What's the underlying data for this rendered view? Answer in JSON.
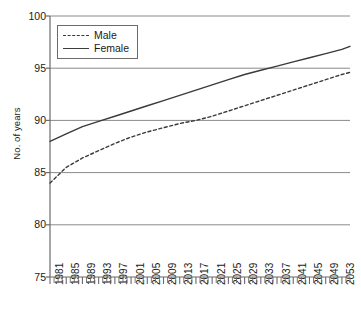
{
  "chart_data": {
    "type": "line",
    "title": "",
    "xlabel": "",
    "ylabel": "No. of years",
    "xlim": [
      1981,
      2055
    ],
    "ylim": [
      75,
      100
    ],
    "yticks": [
      75,
      80,
      85,
      90,
      95,
      100
    ],
    "xticks": [
      1981,
      1985,
      1989,
      1993,
      1997,
      2001,
      2005,
      2009,
      2013,
      2017,
      2021,
      2025,
      2029,
      2033,
      2037,
      2041,
      2045,
      2049,
      2053
    ],
    "grid": "horizontal",
    "legend_position": "top-left",
    "minor_x_tick_step": 1,
    "series": [
      {
        "name": "Male",
        "style": "dashed",
        "color": "#3a3a3a",
        "x": [
          1981,
          1985,
          1989,
          1993,
          1997,
          2001,
          2005,
          2009,
          2013,
          2017,
          2021,
          2025,
          2029,
          2033,
          2037,
          2041,
          2045,
          2049,
          2053,
          2055
        ],
        "values": [
          84.0,
          85.5,
          86.4,
          87.1,
          87.8,
          88.4,
          88.9,
          89.3,
          89.7,
          90.0,
          90.4,
          90.9,
          91.4,
          91.9,
          92.4,
          92.9,
          93.4,
          93.9,
          94.4,
          94.6
        ]
      },
      {
        "name": "Female",
        "style": "solid",
        "color": "#3a3a3a",
        "x": [
          1981,
          1985,
          1989,
          1993,
          1997,
          2001,
          2005,
          2009,
          2013,
          2017,
          2021,
          2025,
          2029,
          2033,
          2037,
          2041,
          2045,
          2049,
          2053,
          2055
        ],
        "values": [
          88.0,
          88.7,
          89.4,
          89.9,
          90.4,
          90.9,
          91.4,
          91.9,
          92.4,
          92.9,
          93.4,
          93.9,
          94.4,
          94.8,
          95.2,
          95.6,
          96.0,
          96.4,
          96.8,
          97.1
        ]
      }
    ]
  },
  "legend": {
    "items": [
      {
        "label": "Male"
      },
      {
        "label": "Female"
      }
    ]
  },
  "colors": {
    "axis": "#6b6b6b",
    "grid": "#8a8a8a",
    "line": "#3a3a3a",
    "text": "#1a1a1a",
    "background": "#ffffff"
  }
}
